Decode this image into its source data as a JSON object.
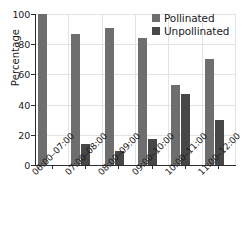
{
  "chart_data": {
    "type": "bar",
    "title": "",
    "subtitle": "",
    "xlabel": "",
    "ylabel": "Percentage",
    "ylim": [
      0,
      100
    ],
    "yticks": [
      0,
      20,
      40,
      60,
      80,
      100
    ],
    "grid": true,
    "legend_position": "top-right",
    "categories": [
      "06:00–07:00",
      "07:00–08:00",
      "08:00–09:00",
      "09:00–10:00",
      "10:00–11:00",
      "11:00–12:00"
    ],
    "series": [
      {
        "name": "Pollinated",
        "color": "#6e6e6e",
        "values": [
          100,
          87,
          91,
          84,
          53,
          70
        ]
      },
      {
        "name": "Unpollinated",
        "color": "#474747",
        "values": [
          0,
          14,
          9,
          17,
          47,
          30
        ]
      }
    ]
  },
  "axis": {
    "y_label": "Percentage"
  },
  "colors": {
    "pollinated": "#6e6e6e",
    "unpollinated": "#474747",
    "axis": "#2b2b2b",
    "grid": "#e3e3e3",
    "background": "#ffffff",
    "text": "#1a1a1a"
  }
}
